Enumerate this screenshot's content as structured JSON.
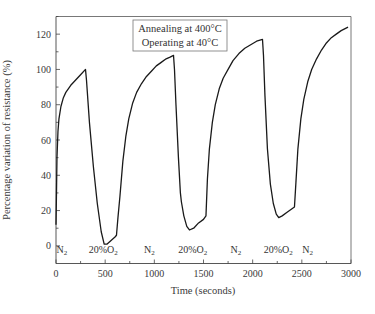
{
  "chart_data": {
    "type": "line",
    "title": "",
    "xlabel": "Time (seconds)",
    "ylabel": "Percentage variation of resistance (%)",
    "xlim": [
      0,
      3000
    ],
    "ylim": [
      -10,
      130
    ],
    "xticks": [
      0,
      500,
      1000,
      1500,
      2000,
      2500,
      3000
    ],
    "xtick_labels": [
      "0",
      "500",
      "1000",
      "1500",
      "2000",
      "2500",
      "3000"
    ],
    "x_minor_step": 250,
    "yticks": [
      0,
      20,
      40,
      60,
      80,
      100,
      120
    ],
    "ytick_labels": [
      "0",
      "20",
      "40",
      "60",
      "80",
      "100",
      "120"
    ],
    "y_minor_step": 10,
    "grid": false,
    "legend": null,
    "annotation_box": {
      "lines": [
        "Annealing at 400°C",
        "Operating at 40°C"
      ],
      "placement": "top-center"
    },
    "phase_labels": [
      {
        "text": "N",
        "sub": "2",
        "x": 60
      },
      {
        "text": "20%O",
        "sub": "2",
        "x": 480
      },
      {
        "text": "N",
        "sub": "2",
        "x": 950
      },
      {
        "text": "20%O",
        "sub": "2",
        "x": 1390
      },
      {
        "text": "N",
        "sub": "2",
        "x": 1830
      },
      {
        "text": "20%O",
        "sub": "2",
        "x": 2260
      },
      {
        "text": "N",
        "sub": "2",
        "x": 2560
      }
    ],
    "series": [
      {
        "name": "Resistance variation",
        "color": "#1a1a1a",
        "x": [
          0,
          5,
          10,
          20,
          30,
          50,
          75,
          100,
          150,
          200,
          250,
          300,
          310,
          340,
          380,
          420,
          460,
          490,
          520,
          560,
          600,
          615,
          630,
          650,
          680,
          710,
          740,
          780,
          820,
          870,
          920,
          970,
          1020,
          1070,
          1120,
          1160,
          1195,
          1205,
          1220,
          1245,
          1265,
          1275,
          1300,
          1330,
          1357,
          1400,
          1450,
          1500,
          1525,
          1540,
          1560,
          1590,
          1620,
          1660,
          1700,
          1750,
          1800,
          1860,
          1920,
          1980,
          2040,
          2100,
          2110,
          2125,
          2150,
          2180,
          2210,
          2240,
          2265,
          2300,
          2350,
          2400,
          2425,
          2440,
          2460,
          2490,
          2520,
          2560,
          2600,
          2650,
          2700,
          2750,
          2800,
          2850,
          2900,
          2970
        ],
        "y": [
          12,
          30,
          50,
          65,
          72,
          79,
          84,
          87,
          91,
          94,
          97,
          100,
          94,
          70,
          45,
          24,
          8,
          1,
          1,
          3,
          5,
          6,
          16,
          28,
          48,
          62,
          72,
          81,
          87,
          92,
          96,
          99,
          102,
          104,
          106,
          107,
          108,
          100,
          80,
          50,
          30,
          25,
          17,
          11,
          9,
          10,
          13,
          15,
          17,
          38,
          55,
          70,
          80,
          89,
          95,
          100,
          105,
          109,
          112,
          114,
          116,
          117,
          108,
          85,
          55,
          35,
          24,
          18,
          16,
          17,
          19,
          21,
          22,
          36,
          55,
          72,
          83,
          93,
          100,
          106,
          111,
          115,
          118,
          120,
          122,
          124
        ]
      }
    ]
  }
}
